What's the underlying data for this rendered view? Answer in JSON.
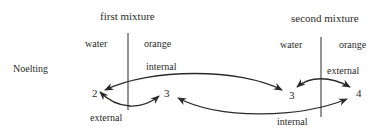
{
  "diagram": {
    "row_label": "Noelting",
    "first_mixture": {
      "title": "first mixture",
      "left_label": "water",
      "right_label": "orange",
      "left_value": "2",
      "right_value": "3"
    },
    "second_mixture": {
      "title": "second mixture",
      "left_label": "water",
      "right_label": "orange",
      "left_value": "3",
      "right_value": "4"
    },
    "relations": {
      "internal_top": "internal",
      "external_first": "external",
      "external_second": "external",
      "internal_bottom": "internal"
    },
    "colors": {
      "ink": "#2a2a2a",
      "background": "#ffffff"
    }
  }
}
